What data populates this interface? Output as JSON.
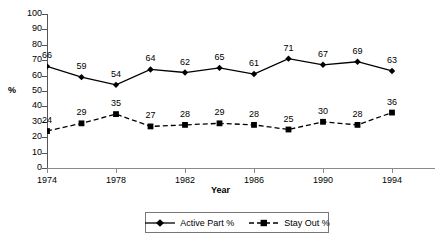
{
  "chart_data": {
    "type": "line",
    "title": "",
    "xlabel": "Year",
    "ylabel": "%",
    "ylim": [
      0,
      100
    ],
    "ytick_step": 10,
    "grid": false,
    "legend_position": "bottom",
    "x": [
      1974,
      1978,
      1982,
      1986,
      1990,
      1994,
      1998,
      2002,
      2004,
      2006,
      2008
    ],
    "x_tick_labels": [
      "1974",
      "1978",
      "1982",
      "1986",
      "1990",
      "1994",
      "1998",
      "2002",
      "2006"
    ],
    "y_tick_labels": [
      "100",
      "90",
      "80",
      "70",
      "60",
      "50",
      "40",
      "30",
      "20",
      "10",
      "0"
    ],
    "series": [
      {
        "name": "Active Part %",
        "marker": "diamond",
        "line_style": "solid",
        "color": "#000000",
        "values": [
          66,
          59,
          54,
          64,
          62,
          65,
          61,
          71,
          67,
          69,
          63
        ]
      },
      {
        "name": "Stay Out %",
        "marker": "square",
        "line_style": "dashed",
        "color": "#000000",
        "values": [
          24,
          29,
          35,
          27,
          28,
          29,
          28,
          25,
          30,
          28,
          36
        ]
      }
    ]
  },
  "legend": {
    "items": [
      {
        "label": "Active Part %"
      },
      {
        "label": "Stay Out %"
      }
    ]
  },
  "axes": {
    "x_title": "Year",
    "y_title": "%"
  }
}
